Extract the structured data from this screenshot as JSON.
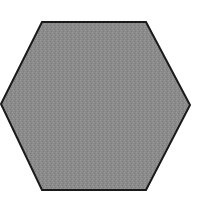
{
  "shape": {
    "type": "hexagon",
    "fill": "#8b8b8b",
    "stroke": "#1a1a1a",
    "stroke_width": 2,
    "points": [
      [
        42,
        22
      ],
      [
        146,
        22
      ],
      [
        190,
        105
      ],
      [
        146,
        190
      ],
      [
        42,
        190
      ],
      [
        1,
        104
      ]
    ]
  }
}
